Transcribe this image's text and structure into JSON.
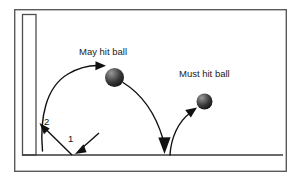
{
  "figure": {
    "type": "ball-trajectory-diagram",
    "background_color": "#ffffff",
    "frame": {
      "name": "outer-frame",
      "x": 14,
      "y": 9,
      "width": 273,
      "height": 163,
      "stroke_color": "#5a5a5a",
      "stroke_width": 1.4
    },
    "wall": {
      "name": "wall-rectangle",
      "x": 22,
      "y": 14,
      "width": 14,
      "height": 141,
      "stroke_color": "#4f4f4f",
      "stroke_width": 1.3
    },
    "ground": {
      "name": "ground-line",
      "x1": 22,
      "y1": 155,
      "x2": 283,
      "y2": 155,
      "stroke_color": "#3a3a3a",
      "stroke_width": 1.5
    }
  },
  "labels": {
    "may_hit": "May hit ball",
    "must_hit": "Must hit ball",
    "step_one": "1",
    "step_two": "2"
  },
  "balls": [
    {
      "name": "may-hit-ball",
      "cx": 114.5,
      "cy": 77.5,
      "r": 9.5,
      "color_light": "#8e8e8e",
      "color_dark": "#171717"
    },
    {
      "name": "must-hit-ball",
      "cx": 204.5,
      "cy": 101.5,
      "r": 8.0,
      "color_light": "#8e8e8e",
      "color_dark": "#171717"
    }
  ],
  "paths": [
    {
      "name": "incoming-serve-arrow",
      "description": "straight arrow from upper right to ground bounce point",
      "stroke_color": "#111111",
      "stroke_width": 1.4
    },
    {
      "name": "bounce-to-wall-arrow",
      "description": "straight arrow from ground bounce point up-left to wall",
      "stroke_color": "#111111",
      "stroke_width": 1.4
    },
    {
      "name": "wall-rebound-arc",
      "description": "curve from wall base arcing up-right into may-hit ball",
      "stroke_color": "#111111",
      "stroke_width": 1.4
    },
    {
      "name": "descending-arc",
      "description": "curve from may-hit ball down to ground with down arrow",
      "stroke_color": "#111111",
      "stroke_width": 1.4
    },
    {
      "name": "ascending-arc",
      "description": "curve from ground up-right into must-hit ball",
      "stroke_color": "#111111",
      "stroke_width": 1.4
    }
  ],
  "colors": {
    "ink": "#111111",
    "frame": "#5a5a5a",
    "ground": "#3a3a3a"
  }
}
